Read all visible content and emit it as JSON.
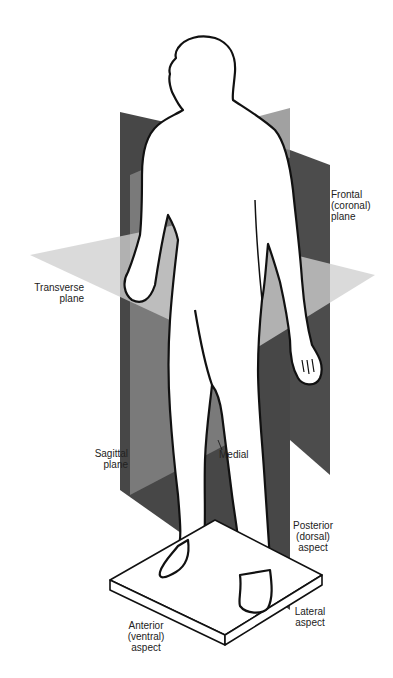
{
  "diagram": {
    "type": "anatomical-planes",
    "labels": {
      "frontal": "Frontal\n(coronal)\nplane",
      "transverse": "Transverse\nplane",
      "sagittal": "Sagittal\nplane",
      "medial": "Medial",
      "posterior": "Posterior\n(dorsal)\naspect",
      "lateral": "Lateral\naspect",
      "anterior": "Anterior\n(ventral)\naspect"
    },
    "colors": {
      "frontal_plane": "#4a4a4a",
      "sagittal_plane": "#7a7a7a",
      "transverse_plane": "#c8c8c8",
      "outline": "#111111",
      "background": "#ffffff",
      "platform": "#ffffff"
    }
  }
}
